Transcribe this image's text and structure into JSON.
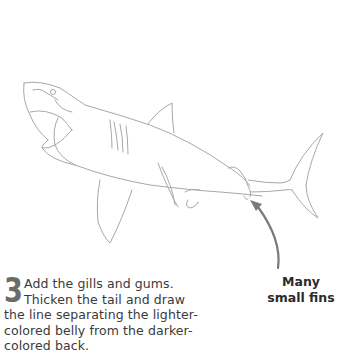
{
  "step": {
    "number": "3",
    "text": "Add the gills and gums. Thicken the tail and draw the line separating the lighter-colored belly from the darker-colored back."
  },
  "annotation": {
    "line1": "Many",
    "line2": "small fins"
  },
  "colors": {
    "sketch_line": "#a8a8a8",
    "arrow": "#7a7a7a",
    "step_number": "#6b6b6b",
    "text": "#2b2b2b"
  },
  "illustration": {
    "subject": "shark-sketch"
  }
}
